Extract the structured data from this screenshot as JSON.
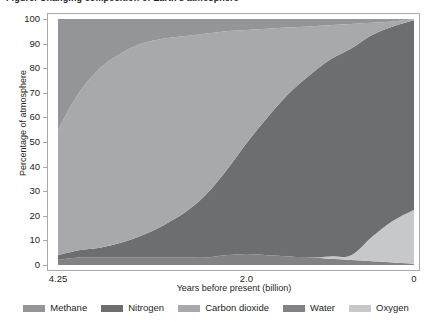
{
  "title": "Figure: Changing composition of Earth's atmosphere",
  "chart_data": {
    "type": "area",
    "title": "Changing composition of Earth's atmosphere",
    "xlabel": "Years before present (billion)",
    "ylabel": "Percentage of atmosphere",
    "xlim": [
      4.25,
      0
    ],
    "ylim": [
      0,
      100
    ],
    "grid": false,
    "legend_position": "bottom",
    "stacked": true,
    "xticks": [
      "4.25",
      "2.0",
      "0"
    ],
    "xtick_values": [
      4.25,
      2.0,
      0
    ],
    "yticks": [
      "0",
      "10",
      "20",
      "30",
      "40",
      "50",
      "60",
      "70",
      "80",
      "90",
      "100"
    ],
    "ytick_values": [
      0,
      10,
      20,
      30,
      40,
      50,
      60,
      70,
      80,
      90,
      100
    ],
    "x": [
      4.25,
      4.0,
      3.75,
      3.5,
      3.25,
      3.0,
      2.75,
      2.5,
      2.25,
      2.0,
      1.75,
      1.5,
      1.25,
      1.0,
      0.75,
      0.5,
      0.25,
      0.0
    ],
    "series": [
      {
        "name": "Methane",
        "color": "#939598",
        "values": [
          45,
          30,
          20,
          14,
          10,
          8,
          7,
          6,
          5,
          4.5,
          4,
          3.5,
          3,
          2.5,
          2,
          1.5,
          1,
          0.5
        ]
      },
      {
        "name": "Nitrogen",
        "color": "#6d6e71",
        "values": [
          2,
          3,
          4,
          6,
          9,
          13,
          18,
          25,
          34,
          45,
          56,
          66,
          74,
          80,
          84,
          82,
          79,
          77
        ]
      },
      {
        "name": "Carbon dioxide",
        "color": "#a7a9ac",
        "values": [
          51,
          64,
          73,
          77,
          78,
          76,
          72,
          66,
          57,
          46,
          36,
          27,
          20,
          14,
          10,
          5,
          2,
          0.5
        ]
      },
      {
        "name": "Water",
        "color": "#808285",
        "values": [
          2,
          3,
          3,
          3,
          3,
          3,
          3,
          3,
          4,
          4.5,
          4,
          3.5,
          3,
          2.5,
          2,
          1.5,
          1,
          0.5
        ]
      },
      {
        "name": "Oxygen",
        "color": "#c7c8ca",
        "values": [
          0,
          0,
          0,
          0,
          0,
          0,
          0,
          0,
          0,
          0,
          0,
          0,
          0,
          1,
          2,
          10,
          17,
          22
        ]
      }
    ]
  },
  "legend": {
    "items": [
      {
        "label": "Methane",
        "color": "#939598"
      },
      {
        "label": "Nitrogen",
        "color": "#6d6e71"
      },
      {
        "label": "Carbon dioxide",
        "color": "#a7a9ac"
      },
      {
        "label": "Water",
        "color": "#808285"
      },
      {
        "label": "Oxygen",
        "color": "#c7c8ca"
      }
    ]
  }
}
